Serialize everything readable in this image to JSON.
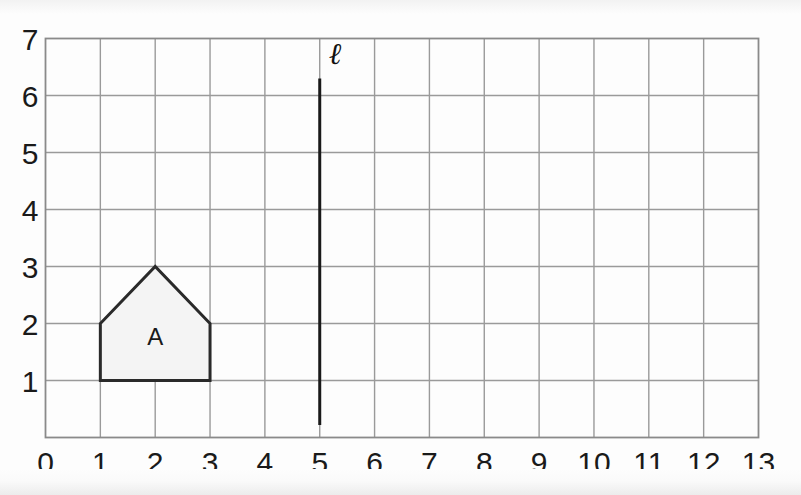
{
  "figure": {
    "kind": "coordinate-grid-reflection-task",
    "background_color": "#fdfdfd",
    "grid_line_color": "#9a9a9a",
    "grid_border_color": "#8a8a8a",
    "shape_stroke_color": "#2a2a2a",
    "shape_fill_color": "#f4f4f4",
    "mirror_line_color": "#1a1a1a"
  },
  "axes": {
    "x": {
      "label": "",
      "min": 0,
      "max": 13,
      "ticks": [
        "0",
        "1",
        "2",
        "3",
        "4",
        "5",
        "6",
        "7",
        "8",
        "9",
        "10",
        "11",
        "12",
        "13"
      ]
    },
    "y": {
      "label": "",
      "min": 0,
      "max": 7,
      "ticks": [
        "0",
        "1",
        "2",
        "3",
        "4",
        "5",
        "6",
        "7"
      ],
      "rendered_ticks": [
        "1",
        "2",
        "3",
        "4",
        "5",
        "6",
        "7"
      ]
    },
    "grid": "on"
  },
  "chart_data": {
    "type": "scatter",
    "title": "",
    "xlabel": "",
    "ylabel": "",
    "xlim": [
      0,
      13
    ],
    "ylim": [
      0,
      7
    ],
    "grid": true,
    "legend": "none",
    "shapes": [
      {
        "name": "shape-a",
        "label": "A",
        "label_position": {
          "x": 2,
          "y": 1.62
        },
        "type": "pentagon",
        "vertices": [
          {
            "x": 1,
            "y": 1
          },
          {
            "x": 3,
            "y": 1
          },
          {
            "x": 3,
            "y": 2
          },
          {
            "x": 2,
            "y": 3
          },
          {
            "x": 1,
            "y": 2
          }
        ],
        "fill": "#f4f4f4",
        "stroke": "#2a2a2a"
      }
    ],
    "lines": [
      {
        "name": "mirror-line",
        "label": "ℓ",
        "label_position": {
          "x": 5.28,
          "y": 6.55
        },
        "orientation": "vertical",
        "equation": "x = 5",
        "x": 5,
        "y_start": 0.22,
        "y_end": 6.3,
        "stroke": "#1a1a1a",
        "stroke_width": 3
      }
    ]
  }
}
